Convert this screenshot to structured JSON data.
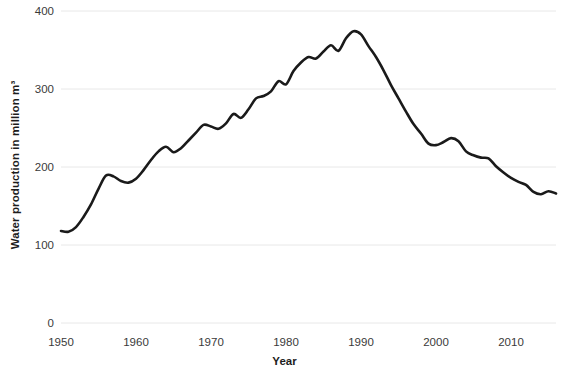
{
  "chart_data": {
    "type": "line",
    "title": "",
    "xlabel": "Year",
    "ylabel": "Water production in million m³",
    "xlim": [
      1950,
      2016
    ],
    "ylim": [
      0,
      400
    ],
    "grid": true,
    "legend": false,
    "xticks": [
      "1950",
      "1960",
      "1970",
      "1980",
      "1990",
      "2000",
      "2010"
    ],
    "xtick_values": [
      1950,
      1960,
      1970,
      1980,
      1990,
      2000,
      2010
    ],
    "yticks": [
      "0",
      "100",
      "200",
      "300",
      "400"
    ],
    "ytick_values": [
      0,
      100,
      200,
      300,
      400
    ],
    "line_color": "#1a1a1a",
    "line_width": 2.6,
    "x": [
      1950,
      1951,
      1952,
      1953,
      1954,
      1955,
      1956,
      1957,
      1958,
      1959,
      1960,
      1961,
      1962,
      1963,
      1964,
      1965,
      1966,
      1967,
      1968,
      1969,
      1970,
      1971,
      1972,
      1973,
      1974,
      1975,
      1976,
      1977,
      1978,
      1979,
      1980,
      1981,
      1982,
      1983,
      1984,
      1985,
      1986,
      1987,
      1988,
      1989,
      1990,
      1991,
      1992,
      1993,
      1994,
      1995,
      1996,
      1997,
      1998,
      1999,
      2000,
      2001,
      2002,
      2003,
      2004,
      2005,
      2006,
      2007,
      2008,
      2009,
      2010,
      2011,
      2012,
      2013,
      2014,
      2015,
      2016
    ],
    "values": [
      118,
      117,
      123,
      136,
      152,
      172,
      189,
      188,
      182,
      180,
      185,
      196,
      209,
      220,
      226,
      219,
      224,
      234,
      244,
      254,
      252,
      249,
      256,
      268,
      263,
      274,
      288,
      291,
      297,
      310,
      306,
      323,
      334,
      341,
      339,
      348,
      356,
      349,
      365,
      374,
      370,
      355,
      341,
      324,
      305,
      288,
      271,
      255,
      243,
      230,
      228,
      232,
      237,
      233,
      220,
      215,
      212,
      211,
      201,
      193,
      186,
      181,
      177,
      168,
      165,
      169,
      166
    ],
    "series_name": "Water production"
  },
  "axes": {
    "y_title": "Water production in million m³",
    "x_title": "Year"
  }
}
